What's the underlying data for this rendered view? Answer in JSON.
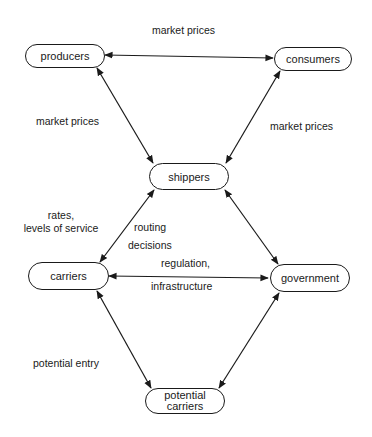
{
  "nodes": {
    "producers": "producers",
    "consumers": "consumers",
    "shippers": "shippers",
    "carriers": "carriers",
    "government": "government",
    "potential_carriers_line1": "potential",
    "potential_carriers_line2": "carriers"
  },
  "edge_labels": {
    "producers_consumers": "market prices",
    "producers_shippers": "market prices",
    "consumers_shippers": "market prices",
    "shippers_carriers_line1": "rates,",
    "shippers_carriers_line2": "levels of service",
    "carriers_shippers_routing_line1": "routing",
    "carriers_shippers_routing_line2": "decisions",
    "carriers_government_line1": "regulation,",
    "carriers_government_line2": "infrastructure",
    "carriers_potential": "potential entry"
  },
  "edges": [
    {
      "from": "producers",
      "to": "consumers",
      "bidirectional": true
    },
    {
      "from": "producers",
      "to": "shippers",
      "bidirectional": true
    },
    {
      "from": "consumers",
      "to": "shippers",
      "bidirectional": true
    },
    {
      "from": "shippers",
      "to": "carriers",
      "bidirectional": true
    },
    {
      "from": "shippers",
      "to": "government",
      "bidirectional": true
    },
    {
      "from": "carriers",
      "to": "government",
      "bidirectional": true
    },
    {
      "from": "carriers",
      "to": "potential carriers",
      "bidirectional": true
    },
    {
      "from": "government",
      "to": "potential carriers",
      "bidirectional": true
    }
  ]
}
